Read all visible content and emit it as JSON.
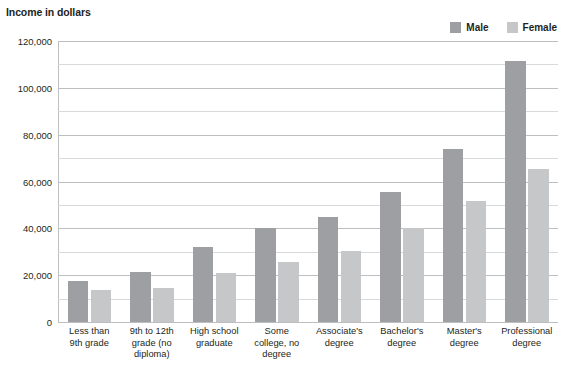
{
  "chart_data": {
    "type": "bar",
    "title": "Income in dollars",
    "xlabel": "",
    "ylabel": "Income in dollars",
    "ylim": [
      0,
      120000
    ],
    "grid": true,
    "grid_major_step": 20000,
    "grid_minor_step": 10000,
    "legend_position": "top-right",
    "categories": [
      "Less than 9th grade",
      "9th to 12th grade (no diploma)",
      "High school graduate",
      "Some college, no degree",
      "Associate's degree",
      "Bachelor's degree",
      "Master's degree",
      "Professional degree"
    ],
    "category_lines": [
      [
        "Less than",
        "9th grade"
      ],
      [
        "9th to 12th",
        "grade (no",
        "diploma)"
      ],
      [
        "High school",
        "graduate"
      ],
      [
        "Some",
        "college, no",
        "degree"
      ],
      [
        "Associate's",
        "degree"
      ],
      [
        "Bachelor's",
        "degree"
      ],
      [
        "Master's",
        "degree"
      ],
      [
        "Professional",
        "degree"
      ]
    ],
    "series": [
      {
        "name": "Male",
        "color": "#9d9fa2",
        "values": [
          17500,
          21500,
          32000,
          40000,
          45000,
          55500,
          74000,
          111500
        ]
      },
      {
        "name": "Female",
        "color": "#c6c7c9",
        "values": [
          13500,
          14500,
          21000,
          25500,
          30500,
          40000,
          51500,
          65500
        ]
      }
    ],
    "yticks": [
      {
        "value": 120000,
        "label": "120,000",
        "major": true
      },
      {
        "value": 110000,
        "label": "",
        "major": false
      },
      {
        "value": 100000,
        "label": "100,000",
        "major": true
      },
      {
        "value": 90000,
        "label": "",
        "major": false
      },
      {
        "value": 80000,
        "label": "80,000",
        "major": true
      },
      {
        "value": 70000,
        "label": "",
        "major": false
      },
      {
        "value": 60000,
        "label": "60,000",
        "major": true
      },
      {
        "value": 50000,
        "label": "",
        "major": false
      },
      {
        "value": 40000,
        "label": "40,000",
        "major": true
      },
      {
        "value": 30000,
        "label": "",
        "major": false
      },
      {
        "value": 20000,
        "label": "20,000",
        "major": true
      },
      {
        "value": 10000,
        "label": "",
        "major": false
      },
      {
        "value": 0,
        "label": "0",
        "major": true
      }
    ]
  },
  "legend": {
    "entries": [
      {
        "label": "Male",
        "color": "#9d9fa2"
      },
      {
        "label": "Female",
        "color": "#c6c7c9"
      }
    ]
  },
  "colors": {
    "male": "#9d9fa2",
    "female": "#c6c7c9",
    "gridline_major": "#bcbec0",
    "gridline_minor": "#d8d9db",
    "text": "#231f20",
    "background": "#ffffff"
  }
}
